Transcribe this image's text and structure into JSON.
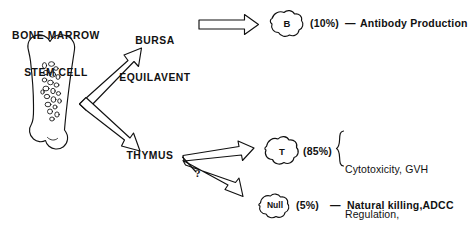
{
  "figure": {
    "background_color": "#ffffff",
    "ink_color": "#111111"
  },
  "source": {
    "label": "BONE MARROW\nSTEM CELL",
    "line1": "BONE MARROW",
    "line2": "STEM CELL",
    "organ_icon": "bone-icon"
  },
  "pathways": {
    "bursa": {
      "line1": "BURSA",
      "line2": "EQUILAVENT"
    },
    "thymus": {
      "label": "THYMUS"
    },
    "uncertain_marker": "?"
  },
  "lineages": [
    {
      "cell": "B",
      "percent": "(10%)",
      "separator": "—",
      "functions": "Antibody Production",
      "function_lines": [
        "Antibody Production"
      ],
      "bracketed": false
    },
    {
      "cell": "T",
      "percent": "(85%)",
      "separator": "",
      "functions": "Cytotoxicity, GVH Regulation, Amplification",
      "function_lines": [
        "Cytotoxicity, GVH",
        "Regulation,",
        "Amplification"
      ],
      "bracketed": true
    },
    {
      "cell": "Null",
      "percent": "(5%)",
      "separator": "—",
      "functions": "Natural killing,ADCC",
      "function_lines": [
        "Natural killing,ADCC"
      ],
      "bracketed": false
    }
  ]
}
